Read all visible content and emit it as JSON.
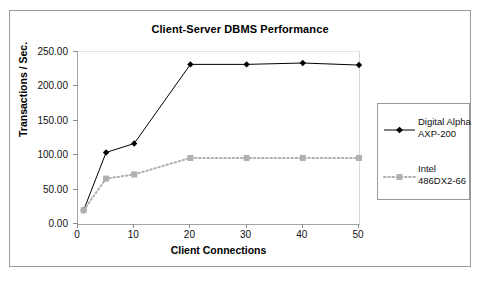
{
  "chart_data": {
    "type": "line",
    "title": "Client-Server DBMS Performance",
    "xlabel": "Client Connections",
    "ylabel": "Transactions / Sec.",
    "x": [
      1,
      5,
      10,
      20,
      30,
      40,
      50
    ],
    "xlim": [
      0,
      50
    ],
    "ylim": [
      0,
      250
    ],
    "xticks": [
      "0",
      "10",
      "20",
      "30",
      "40",
      "50"
    ],
    "xtick_values": [
      0,
      10,
      20,
      30,
      40,
      50
    ],
    "yticks": [
      "0.00",
      "50.00",
      "100.00",
      "150.00",
      "200.00",
      "250.00"
    ],
    "ytick_values": [
      0,
      50,
      100,
      150,
      200,
      250
    ],
    "grid": false,
    "legend_position": "right",
    "series": [
      {
        "name": "Digital Alpha AXP-200",
        "label_line1": "Digital Alpha",
        "label_line2": "AXP-200",
        "color": "#000000",
        "marker": "diamond",
        "linestyle": "solid",
        "values": [
          20,
          104,
          117,
          232,
          232,
          234,
          231
        ]
      },
      {
        "name": "Intel 486DX2-66",
        "label_line1": "Intel",
        "label_line2": "486DX2-66",
        "color": "#b0b0b0",
        "marker": "square",
        "linestyle": "dotted",
        "values": [
          20,
          66,
          72,
          96,
          96,
          96,
          96
        ]
      }
    ]
  }
}
